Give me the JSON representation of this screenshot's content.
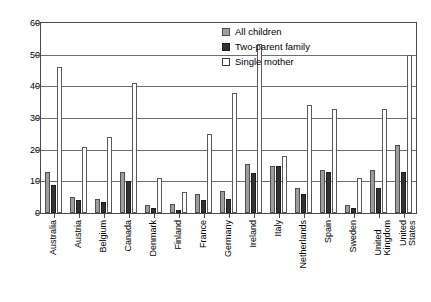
{
  "chart_data": {
    "type": "bar",
    "title": "",
    "xlabel": "",
    "ylabel": "",
    "ylim": [
      0,
      60
    ],
    "yticks": [
      0,
      10,
      20,
      30,
      40,
      50,
      60
    ],
    "grid": true,
    "legend_position": "top-right",
    "categories": [
      "Australia",
      "Austria",
      "Belgium",
      "Canada",
      "Denmark",
      "Finland",
      "France",
      "Germany",
      "Ireland",
      "Italy",
      "Netherlands",
      "Spain",
      "Sweden",
      "United\nKingdom",
      "United\nStates"
    ],
    "series": [
      {
        "name": "All children",
        "color": "#9d9d9d",
        "values": [
          13.0,
          5.0,
          4.5,
          13.0,
          2.5,
          3.0,
          6.0,
          7.0,
          15.5,
          15.0,
          8.0,
          13.5,
          2.5,
          13.5,
          21.5
        ]
      },
      {
        "name": "Two-parent family",
        "color": "#333333",
        "values": [
          9.0,
          4.0,
          3.5,
          10.0,
          1.5,
          1.0,
          4.0,
          4.5,
          12.5,
          15.0,
          6.0,
          13.0,
          1.5,
          8.0,
          13.0
        ]
      },
      {
        "name": "Single mother",
        "color": "#ffffff",
        "values": [
          46.0,
          21.0,
          24.0,
          41.0,
          11.0,
          6.5,
          25.0,
          38.0,
          53.5,
          18.0,
          34.0,
          33.0,
          11.0,
          33.0,
          50.0
        ]
      }
    ]
  },
  "legend": {
    "items": [
      {
        "label": "All children",
        "swatch": "all"
      },
      {
        "label": "Two-parent family",
        "swatch": "two"
      },
      {
        "label": "Single mother",
        "swatch": "single"
      }
    ]
  }
}
